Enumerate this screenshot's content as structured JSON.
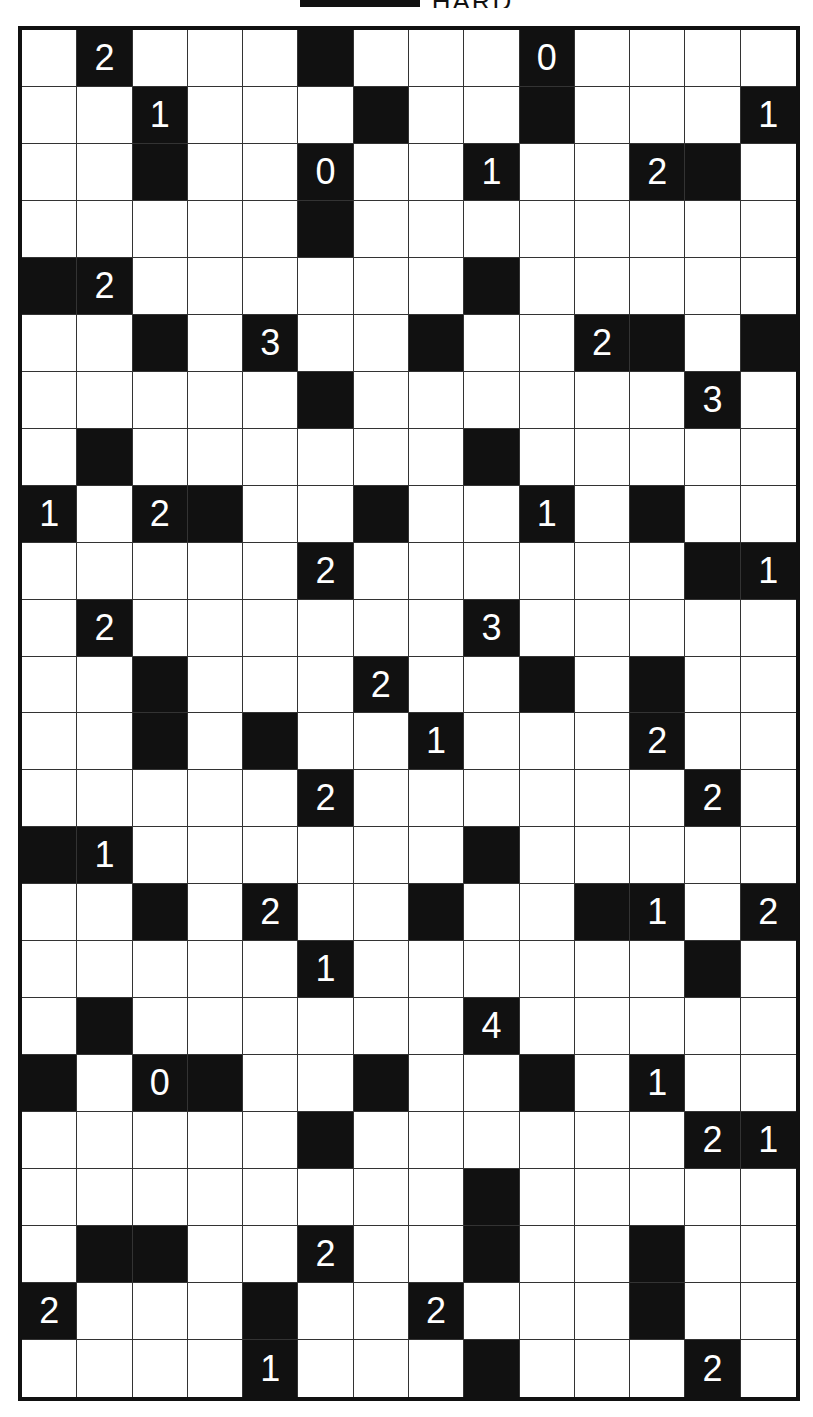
{
  "title": "HARD",
  "puzzle": {
    "type": "akari-light-up",
    "rows": 24,
    "cols": 14,
    "colors": {
      "wall": "#111111",
      "empty": "#ffffff",
      "clue_text": "#ffffff",
      "grid_line": "#333333"
    },
    "walls": [
      [
        0,
        1,
        "2"
      ],
      [
        0,
        5,
        ""
      ],
      [
        0,
        9,
        "0"
      ],
      [
        1,
        2,
        "1"
      ],
      [
        1,
        6,
        ""
      ],
      [
        1,
        9,
        ""
      ],
      [
        1,
        13,
        "1"
      ],
      [
        2,
        2,
        ""
      ],
      [
        2,
        5,
        "0"
      ],
      [
        2,
        8,
        "1"
      ],
      [
        2,
        11,
        "2"
      ],
      [
        2,
        12,
        ""
      ],
      [
        3,
        5,
        ""
      ],
      [
        4,
        0,
        ""
      ],
      [
        4,
        1,
        "2"
      ],
      [
        4,
        8,
        ""
      ],
      [
        5,
        2,
        ""
      ],
      [
        5,
        4,
        "3"
      ],
      [
        5,
        7,
        ""
      ],
      [
        5,
        10,
        "2"
      ],
      [
        5,
        11,
        ""
      ],
      [
        5,
        13,
        ""
      ],
      [
        6,
        5,
        ""
      ],
      [
        6,
        12,
        "3"
      ],
      [
        7,
        1,
        ""
      ],
      [
        7,
        8,
        ""
      ],
      [
        8,
        0,
        "1"
      ],
      [
        8,
        2,
        "2"
      ],
      [
        8,
        3,
        ""
      ],
      [
        8,
        6,
        ""
      ],
      [
        8,
        9,
        "1"
      ],
      [
        8,
        11,
        ""
      ],
      [
        9,
        5,
        "2"
      ],
      [
        9,
        12,
        ""
      ],
      [
        9,
        13,
        "1"
      ],
      [
        10,
        1,
        "2"
      ],
      [
        10,
        8,
        "3"
      ],
      [
        11,
        2,
        ""
      ],
      [
        11,
        6,
        "2"
      ],
      [
        11,
        9,
        ""
      ],
      [
        11,
        11,
        ""
      ],
      [
        12,
        2,
        ""
      ],
      [
        12,
        4,
        ""
      ],
      [
        12,
        7,
        "1"
      ],
      [
        12,
        11,
        "2"
      ],
      [
        13,
        5,
        "2"
      ],
      [
        13,
        12,
        "2"
      ],
      [
        14,
        0,
        ""
      ],
      [
        14,
        1,
        "1"
      ],
      [
        14,
        8,
        ""
      ],
      [
        15,
        2,
        ""
      ],
      [
        15,
        4,
        "2"
      ],
      [
        15,
        7,
        ""
      ],
      [
        15,
        10,
        ""
      ],
      [
        15,
        11,
        "1"
      ],
      [
        15,
        13,
        "2"
      ],
      [
        16,
        5,
        "1"
      ],
      [
        16,
        12,
        ""
      ],
      [
        17,
        1,
        ""
      ],
      [
        17,
        8,
        "4"
      ],
      [
        18,
        0,
        ""
      ],
      [
        18,
        2,
        "0"
      ],
      [
        18,
        3,
        ""
      ],
      [
        18,
        6,
        ""
      ],
      [
        18,
        9,
        ""
      ],
      [
        18,
        11,
        "1"
      ],
      [
        19,
        5,
        ""
      ],
      [
        19,
        12,
        "2"
      ],
      [
        19,
        13,
        "1"
      ],
      [
        20,
        8,
        ""
      ],
      [
        21,
        1,
        ""
      ],
      [
        21,
        2,
        ""
      ],
      [
        21,
        5,
        "2"
      ],
      [
        21,
        8,
        ""
      ],
      [
        21,
        11,
        ""
      ],
      [
        22,
        0,
        "2"
      ],
      [
        22,
        4,
        ""
      ],
      [
        22,
        7,
        "2"
      ],
      [
        22,
        11,
        ""
      ],
      [
        23,
        4,
        "1"
      ],
      [
        23,
        8,
        ""
      ],
      [
        23,
        12,
        "2"
      ]
    ]
  }
}
